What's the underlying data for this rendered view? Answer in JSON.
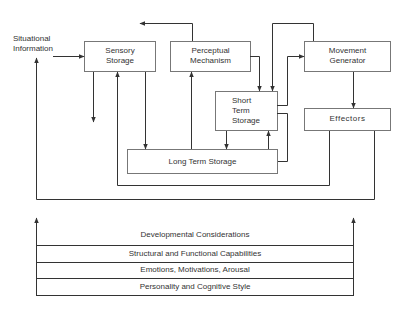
{
  "diagram": {
    "input_label": [
      "Situational",
      "Information"
    ],
    "boxes": {
      "sensory_storage": [
        "Sensory",
        "Storage"
      ],
      "perceptual_mechanism": [
        "Perceptual",
        "Mechanism"
      ],
      "movement_generator": [
        "Movement",
        "Generator"
      ],
      "short_term_storage": [
        "Short",
        "Term",
        "Storage"
      ],
      "effectors": "Effectors",
      "long_term_storage": "Long Term Storage"
    },
    "layers": [
      "Developmental Considerations",
      "Structural and Functional Capabilities",
      "Emotions, Motivations, Arousal",
      "Personality and Cognitive Style"
    ],
    "colors": {
      "line": "#333333",
      "box_border": "#555555",
      "background": "#ffffff"
    }
  }
}
